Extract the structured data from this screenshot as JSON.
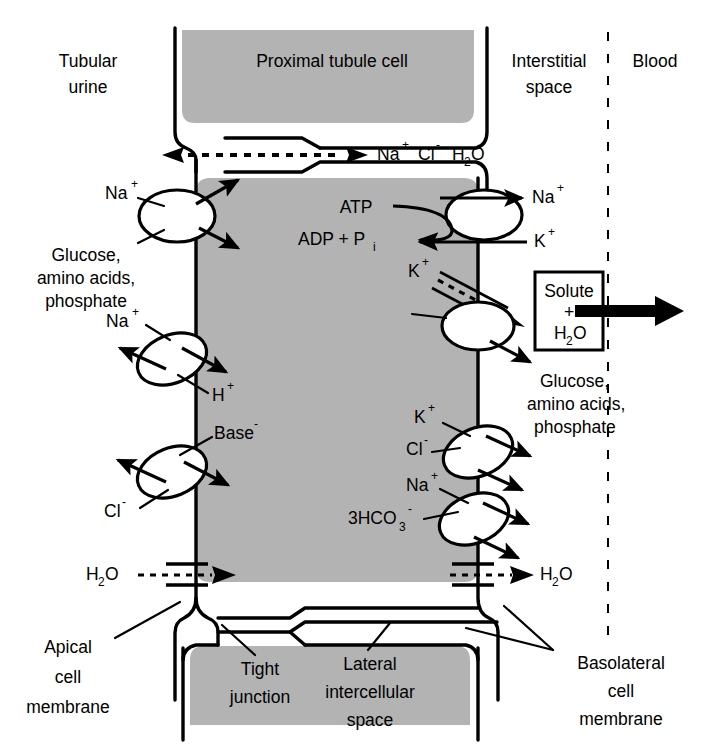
{
  "figure": {
    "cell_label": "Proximal tubule cell",
    "colors": {
      "cytoplasm": "#b3b3b3",
      "membrane": "#000000",
      "background": "#ffffff",
      "carrier_fill": "#ffffff"
    }
  },
  "regions": {
    "left_top": "Tubular",
    "left_bottom": "urine",
    "center": "Proximal tubule cell",
    "right_top": "Interstitial",
    "right_bottom": "space",
    "far_right": "Blood"
  },
  "paracellular": {
    "species": [
      "Na",
      "Cl",
      "H",
      "O"
    ],
    "na_label": "Na",
    "na_charge": "+",
    "cl_label": "Cl",
    "cl_charge": "-",
    "h2o_h": "H",
    "h2o_2": "2",
    "h2o_o": "O"
  },
  "apical_transporters": [
    {
      "id": "sglt-cotransporter",
      "in_labels": [
        "Na+",
        "Glucose, amino acids, phosphate"
      ],
      "label_na": "Na",
      "charge_na": "+",
      "label_substrates_line1": "Glucose,",
      "label_substrates_line2": "amino acids,",
      "label_substrates_line3": "phosphate"
    },
    {
      "id": "sodium-hydrogen-exchanger",
      "label_na": "Na",
      "charge_na": "+",
      "label_h": "H",
      "charge_h": "+"
    },
    {
      "id": "chloride-base-exchanger",
      "label_base": "Base",
      "charge_base": "-",
      "label_cl": "Cl",
      "charge_cl": "-"
    }
  ],
  "apical_water_channel": {
    "label_h": "H",
    "label_2": "2",
    "label_o": "O"
  },
  "basolateral": {
    "atp_label": "ATP",
    "adp_label": "ADP + P",
    "adp_sub": "i",
    "pump_out_label": "Na",
    "pump_out_charge": "+",
    "pump_in_label": "K",
    "pump_in_charge": "+",
    "k_leak_label": "K",
    "k_leak_charge": "+",
    "facilitated_out_line1": "Glucose,",
    "facilitated_out_line2": "amino acids,",
    "facilitated_out_line3": "phosphate",
    "kcl_k_label": "K",
    "kcl_k_charge": "+",
    "kcl_cl_label": "Cl",
    "kcl_cl_charge": "-",
    "nahco3_na_label": "Na",
    "nahco3_na_charge": "+",
    "nahco3_hco3_label": "3HCO",
    "nahco3_hco3_sub": "3",
    "nahco3_hco3_charge": "-",
    "water_h": "H",
    "water_2": "2",
    "water_o": "O"
  },
  "solute_box": {
    "line1": "Solute",
    "line2": "+",
    "line3_h": "H",
    "line3_sub": "2",
    "line3_o": "O"
  },
  "annotations": {
    "apical_line1": "Apical",
    "apical_line2": "cell",
    "apical_line3": "membrane",
    "tight_line1": "Tight",
    "tight_line2": "junction",
    "lateral_line1": "Lateral",
    "lateral_line2": "intercellular",
    "lateral_line3": "space",
    "basolateral_line1": "Basolateral",
    "basolateral_line2": "cell",
    "basolateral_line3": "membrane"
  }
}
